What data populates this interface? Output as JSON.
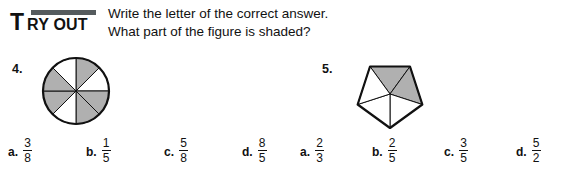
{
  "header": {
    "badge_first_letter": "T",
    "badge_rest": "RY OUT",
    "badge_bar_color": "#555b5e",
    "instruction_line_1": "Write the letter of the correct answer.",
    "instruction_line_2": "What part of the figure is shaded?"
  },
  "colors": {
    "ink": "#111111",
    "shade_fill": "#b0b0b0",
    "unshaded_fill": "#ffffff",
    "stroke": "#111111"
  },
  "questions": [
    {
      "number": "4.",
      "figure": {
        "shape": "circle",
        "total_parts": 8,
        "shaded_parts": 5,
        "shaded_indices": [
          0,
          2,
          3,
          5,
          6
        ]
      },
      "choices": [
        {
          "letter": "a.",
          "numerator": "3",
          "denominator": "8"
        },
        {
          "letter": "b.",
          "numerator": "1",
          "denominator": "5"
        },
        {
          "letter": "c.",
          "numerator": "5",
          "denominator": "8"
        },
        {
          "letter": "d.",
          "numerator": "8",
          "denominator": "5"
        }
      ]
    },
    {
      "number": "5.",
      "figure": {
        "shape": "pentagon",
        "total_parts": 5,
        "shaded_parts": 2,
        "shaded_indices": [
          0,
          1
        ]
      },
      "choices": [
        {
          "letter": "a.",
          "numerator": "2",
          "denominator": "3"
        },
        {
          "letter": "b.",
          "numerator": "2",
          "denominator": "5"
        },
        {
          "letter": "c.",
          "numerator": "3",
          "denominator": "5"
        },
        {
          "letter": "d.",
          "numerator": "5",
          "denominator": "2"
        }
      ]
    }
  ]
}
